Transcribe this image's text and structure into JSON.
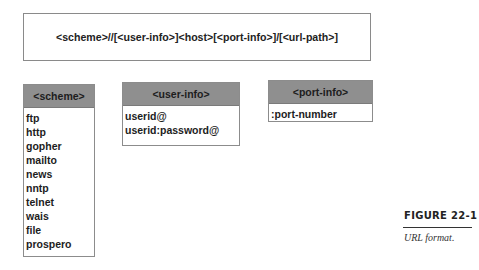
{
  "diagram": {
    "format_string": "<scheme>//[<user-info>]<host>[<port-info>]/[<url-path>]",
    "tables": [
      {
        "header": "<scheme>",
        "items": [
          "ftp",
          "http",
          "gopher",
          "mailto",
          "news",
          "nntp",
          "telnet",
          "wais",
          "file",
          "prospero"
        ]
      },
      {
        "header": "<user-info>",
        "items": [
          "userid@",
          "userid:password@"
        ]
      },
      {
        "header": "<port-info>",
        "items": [
          ":port-number"
        ]
      }
    ]
  },
  "figure": {
    "label": "FIGURE 22-1",
    "caption": "URL format."
  },
  "colors": {
    "header_fill": "#8f8f8f",
    "border": "#8c8c8c",
    "text": "#1d1d1d"
  }
}
